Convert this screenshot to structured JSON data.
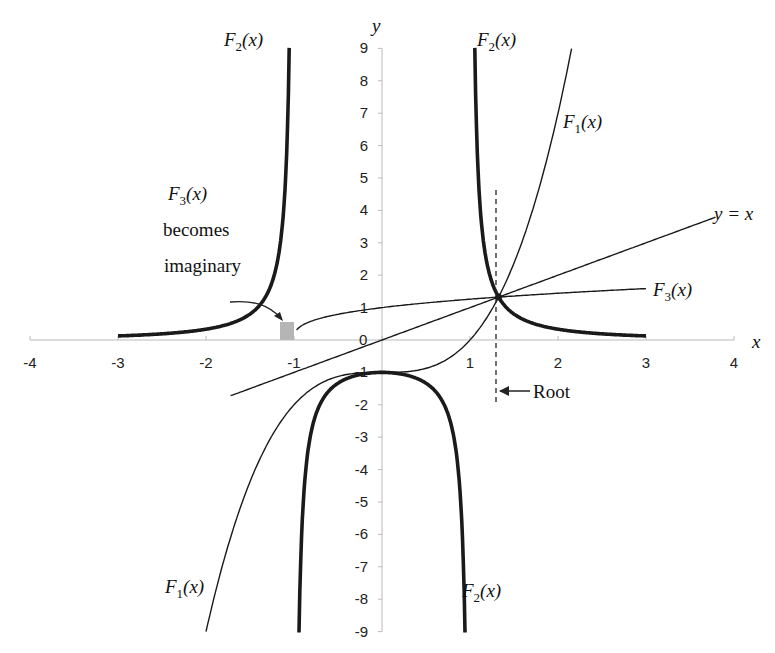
{
  "chart_data": {
    "type": "line",
    "title": "",
    "xlabel": "x",
    "ylabel": "y",
    "xlim": [
      -4,
      4
    ],
    "ylim": [
      -9,
      9
    ],
    "grid": false,
    "x_ticks": [
      -4,
      -3,
      -2,
      -1,
      0,
      1,
      2,
      3,
      4
    ],
    "y_ticks": [
      -9,
      -8,
      -7,
      -6,
      -5,
      -4,
      -3,
      -2,
      -1,
      0,
      1,
      2,
      3,
      4,
      5,
      6,
      7,
      8,
      9
    ],
    "series": [
      {
        "name": "F1(x)",
        "expression": "x^3 - 1",
        "style": "thin-dashed-dark",
        "x_range": [
          -2.0,
          2.154
        ],
        "points": [
          [
            -2,
            -9
          ],
          [
            -1.5,
            -4.375
          ],
          [
            -1,
            -2
          ],
          [
            -0.5,
            -1.125
          ],
          [
            0,
            -1
          ],
          [
            0.5,
            -0.875
          ],
          [
            1,
            0
          ],
          [
            1.3247,
            1.3247
          ],
          [
            1.5,
            2.375
          ],
          [
            2,
            7
          ],
          [
            2.154,
            9
          ]
        ]
      },
      {
        "name": "F2(x)",
        "expression": "1 / (x^2 - 1)",
        "style": "thick",
        "branches": [
          {
            "x_range": [
              -3,
              -1.054
            ],
            "points": [
              [
                -3,
                0.125
              ],
              [
                -2.5,
                0.19
              ],
              [
                -2,
                0.333
              ],
              [
                -1.5,
                0.8
              ],
              [
                -1.2,
                2.27
              ],
              [
                -1.1,
                4.76
              ],
              [
                -1.054,
                9
              ]
            ]
          },
          {
            "x_range": [
              -0.943,
              0.943
            ],
            "points": [
              [
                -0.943,
                -9
              ],
              [
                -0.9,
                -5.26
              ],
              [
                -0.7,
                -1.96
              ],
              [
                -0.5,
                -1.333
              ],
              [
                0,
                -1
              ],
              [
                0.5,
                -1.333
              ],
              [
                0.7,
                -1.96
              ],
              [
                0.9,
                -5.26
              ],
              [
                0.943,
                -9
              ]
            ]
          },
          {
            "x_range": [
              1.054,
              3
            ],
            "points": [
              [
                1.054,
                9
              ],
              [
                1.1,
                4.76
              ],
              [
                1.2,
                2.27
              ],
              [
                1.3247,
                1.3247
              ],
              [
                1.5,
                0.8
              ],
              [
                2,
                0.333
              ],
              [
                2.5,
                0.19
              ],
              [
                3,
                0.125
              ]
            ]
          }
        ]
      },
      {
        "name": "F3(x)",
        "expression": "(x + 1)^(1/3)",
        "style": "thin",
        "x_range": [
          -0.97,
          3
        ],
        "points": [
          [
            -0.97,
            0.31
          ],
          [
            -0.9,
            0.46
          ],
          [
            -0.5,
            0.79
          ],
          [
            0,
            1
          ],
          [
            0.5,
            1.145
          ],
          [
            1,
            1.26
          ],
          [
            1.3247,
            1.3247
          ],
          [
            2,
            1.442
          ],
          [
            3,
            1.587
          ]
        ]
      },
      {
        "name": "y = x",
        "expression": "x",
        "style": "thin",
        "x_range": [
          -1.72,
          3.79
        ],
        "points": [
          [
            -1.72,
            -1.72
          ],
          [
            3.79,
            3.79
          ]
        ]
      }
    ],
    "annotations": [
      {
        "text": "Root",
        "x": 1.3247,
        "y": 1.3247,
        "marker": "dashed vertical line with arrow"
      },
      {
        "text": "F3(x) becomes imaginary",
        "x": -1.1,
        "y": 0.25,
        "marker": "gray shaded box with curved arrow"
      }
    ],
    "root": {
      "x": 1.3247,
      "y": 1.3247
    }
  },
  "labels": {
    "x_axis": "x",
    "y_axis": "y",
    "zero": "0",
    "f1_top": {
      "name": "F",
      "sub": "1",
      "arg": "(x)"
    },
    "f1_bottom": {
      "name": "F",
      "sub": "1",
      "arg": "(x)"
    },
    "f2_left": {
      "name": "F",
      "sub": "2",
      "arg": "(x)"
    },
    "f2_right_top": {
      "name": "F",
      "sub": "2",
      "arg": "(x)"
    },
    "f2_bottom": {
      "name": "F",
      "sub": "2",
      "arg": "(x)"
    },
    "f3_right": {
      "name": "F",
      "sub": "3",
      "arg": "(x)"
    },
    "f3_note": {
      "name": "F",
      "sub": "3",
      "arg": "(x)",
      "line2": "becomes",
      "line3": "imaginary"
    },
    "yx": "y = x",
    "root": "Root"
  },
  "colors": {
    "axis": "#bbbbbb",
    "curve": "#1a1a1a",
    "imaginary_box": "#b5b5b5",
    "text": "#111111"
  }
}
